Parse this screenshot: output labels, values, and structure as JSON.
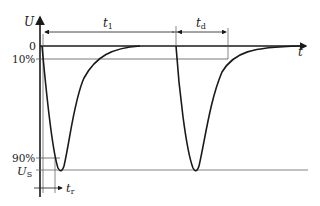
{
  "diagram": {
    "type": "pulse-timing-waveform",
    "axes": {
      "y_label": "U",
      "x_label": "t"
    },
    "levels": {
      "zero": "0",
      "ten_percent": "10%",
      "ninety_percent": "90%",
      "us_base": "U",
      "us_sub": "S"
    },
    "intervals": {
      "t1_base": "t",
      "t1_sub": "1",
      "td_base": "t",
      "td_sub": "d",
      "tr_base": "t",
      "tr_sub": "r"
    },
    "colors": {
      "stroke": "#1a1a1a",
      "guide": "#555555",
      "background": "#ffffff"
    }
  }
}
